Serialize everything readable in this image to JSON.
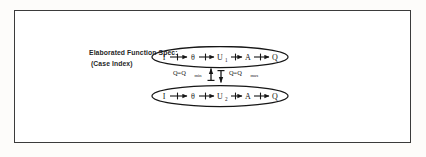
{
  "figure": {
    "caption_line1": "Elaborated Function Spec:",
    "caption_line2": "(Case Index)",
    "frame_color": "#3b3b3b",
    "ink_color": "#161616"
  },
  "diagram": {
    "type": "state-flow",
    "nodes_top": [
      "I",
      "θ",
      "U",
      "A",
      "Q"
    ],
    "node_top_subscripts": [
      "",
      "",
      "1",
      "",
      ""
    ],
    "nodes_bottom": [
      "I",
      "θ",
      "U",
      "A",
      "Q"
    ],
    "node_bottom_subscripts": [
      "",
      "",
      "2",
      "",
      ""
    ],
    "transition_left": {
      "text": "Q=Q",
      "subscript": "min"
    },
    "transition_right": {
      "text": "Q=Q",
      "subscript": "max"
    },
    "arrow_style": "hatched-arrow",
    "group_shape": "ellipse"
  }
}
